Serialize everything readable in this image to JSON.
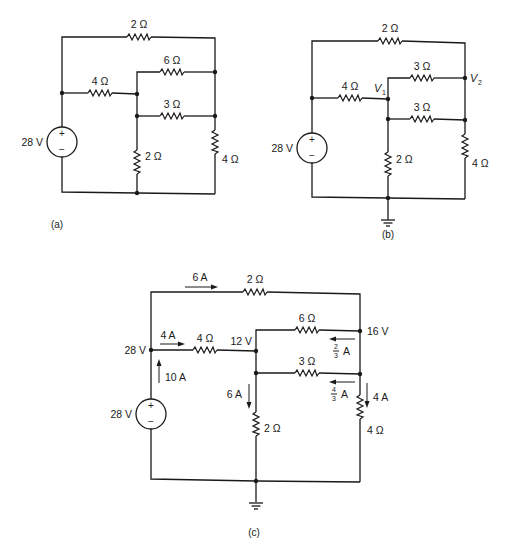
{
  "figures": {
    "a": {
      "caption": "(a)",
      "source": {
        "label": "28 V",
        "plus": "+",
        "minus": "−"
      },
      "resistors": {
        "top": "2 Ω",
        "left_mid": "4 Ω",
        "upper_right": "6 Ω",
        "middle_right": "3 Ω",
        "center_vertical": "2 Ω",
        "right_vertical": "4 Ω"
      }
    },
    "b": {
      "caption": "(b)",
      "source": {
        "label": "28 V",
        "plus": "+",
        "minus": "−"
      },
      "resistors": {
        "top": "2 Ω",
        "left_mid": "4 Ω",
        "upper_right": "6 Ω",
        "middle_right": "3 Ω",
        "center_vertical": "2 Ω",
        "right_vertical": "4 Ω"
      },
      "nodes": {
        "v1": {
          "main": "V",
          "sub": "1"
        },
        "v2": {
          "main": "V",
          "sub": "2"
        }
      }
    },
    "c": {
      "caption": "(c)",
      "source": {
        "label": "28 V",
        "plus": "+",
        "minus": "−"
      },
      "resistors": {
        "top": "2 Ω",
        "left_mid": "4 Ω",
        "upper_right": "6 Ω",
        "middle_right": "3 Ω",
        "center_vertical": "2 Ω",
        "right_vertical": "4 Ω"
      },
      "node_voltages": {
        "left": "28 V",
        "center": "12 V",
        "right": "16 V"
      },
      "currents": {
        "top": "6 A",
        "left_mid": "4 A",
        "source": "10 A",
        "center_vertical": "6 A",
        "right_vertical": "4 A",
        "upper_right": {
          "num": "2",
          "den": "3",
          "unit": "A"
        },
        "middle_right": {
          "num": "4",
          "den": "3",
          "unit": "A"
        }
      }
    }
  }
}
